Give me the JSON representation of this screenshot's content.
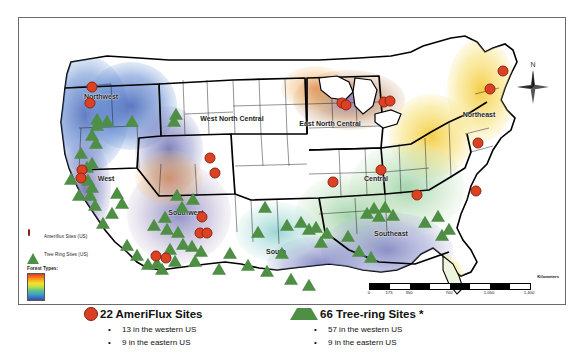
{
  "map": {
    "frame_label": "us-forest-types-site-map",
    "legend": {
      "title": "Forest Types:",
      "items": [
        {
          "icon": "circle-marker-icon",
          "label": "Ameriflux Sites (US)",
          "color": "#dc4123"
        },
        {
          "icon": "triangle-marker-icon",
          "label": "Tree Ring Sites (US)",
          "color": "#4f8f45"
        }
      ],
      "ramp_colors": [
        "#e23c1e",
        "#ef6b1f",
        "#f7a81e",
        "#f4e12a",
        "#b9e04a",
        "#5fc08c",
        "#3aa6c2",
        "#3f6fbe",
        "#3b4fa8"
      ]
    },
    "north_arrow": {
      "label": "N",
      "icon": "compass-rose-icon"
    },
    "scale_bar": {
      "units": "Kilometers",
      "ticks": [
        "0",
        "175",
        "350",
        "700",
        "1,050",
        "1,400"
      ]
    },
    "regions": [
      {
        "name": "Northwest",
        "x": 82,
        "y": 78
      },
      {
        "name": "West North Central",
        "x": 213,
        "y": 100
      },
      {
        "name": "East North Central",
        "x": 311,
        "y": 105
      },
      {
        "name": "Northeast",
        "x": 460,
        "y": 96
      },
      {
        "name": "West",
        "x": 87,
        "y": 160
      },
      {
        "name": "Southwest",
        "x": 167,
        "y": 194
      },
      {
        "name": "Central",
        "x": 357,
        "y": 160
      },
      {
        "name": "South",
        "x": 257,
        "y": 233
      },
      {
        "name": "Southeast",
        "x": 372,
        "y": 215
      }
    ],
    "ameriflux_sites": [
      {
        "x": 73,
        "y": 69
      },
      {
        "x": 71,
        "y": 85
      },
      {
        "x": 63,
        "y": 152
      },
      {
        "x": 62,
        "y": 160
      },
      {
        "x": 191,
        "y": 140
      },
      {
        "x": 196,
        "y": 155
      },
      {
        "x": 183,
        "y": 199
      },
      {
        "x": 181,
        "y": 215
      },
      {
        "x": 188,
        "y": 215
      },
      {
        "x": 137,
        "y": 238
      },
      {
        "x": 147,
        "y": 240
      },
      {
        "x": 323,
        "y": 85
      },
      {
        "x": 327,
        "y": 87
      },
      {
        "x": 365,
        "y": 84
      },
      {
        "x": 371,
        "y": 83
      },
      {
        "x": 362,
        "y": 152
      },
      {
        "x": 314,
        "y": 164
      },
      {
        "x": 484,
        "y": 53
      },
      {
        "x": 471,
        "y": 71
      },
      {
        "x": 459,
        "y": 125
      },
      {
        "x": 457,
        "y": 173
      },
      {
        "x": 398,
        "y": 177
      }
    ],
    "treering_sites": [
      {
        "x": 78,
        "y": 102
      },
      {
        "x": 78,
        "y": 108
      },
      {
        "x": 88,
        "y": 104
      },
      {
        "x": 73,
        "y": 118
      },
      {
        "x": 77,
        "y": 126
      },
      {
        "x": 62,
        "y": 136
      },
      {
        "x": 113,
        "y": 104
      },
      {
        "x": 155,
        "y": 104
      },
      {
        "x": 68,
        "y": 150
      },
      {
        "x": 73,
        "y": 146
      },
      {
        "x": 69,
        "y": 163
      },
      {
        "x": 73,
        "y": 170
      },
      {
        "x": 71,
        "y": 178
      },
      {
        "x": 76,
        "y": 188
      },
      {
        "x": 52,
        "y": 162
      },
      {
        "x": 60,
        "y": 178
      },
      {
        "x": 157,
        "y": 97
      },
      {
        "x": 158,
        "y": 178
      },
      {
        "x": 174,
        "y": 182
      },
      {
        "x": 146,
        "y": 200
      },
      {
        "x": 163,
        "y": 190
      },
      {
        "x": 135,
        "y": 208
      },
      {
        "x": 148,
        "y": 212
      },
      {
        "x": 159,
        "y": 215
      },
      {
        "x": 164,
        "y": 227
      },
      {
        "x": 151,
        "y": 232
      },
      {
        "x": 173,
        "y": 229
      },
      {
        "x": 138,
        "y": 246
      },
      {
        "x": 156,
        "y": 244
      },
      {
        "x": 182,
        "y": 234
      },
      {
        "x": 176,
        "y": 244
      },
      {
        "x": 129,
        "y": 247
      },
      {
        "x": 143,
        "y": 252
      },
      {
        "x": 268,
        "y": 208
      },
      {
        "x": 282,
        "y": 205
      },
      {
        "x": 290,
        "y": 212
      },
      {
        "x": 297,
        "y": 210
      },
      {
        "x": 308,
        "y": 216
      },
      {
        "x": 302,
        "y": 225
      },
      {
        "x": 329,
        "y": 219
      },
      {
        "x": 272,
        "y": 262
      },
      {
        "x": 290,
        "y": 268
      },
      {
        "x": 263,
        "y": 236
      },
      {
        "x": 246,
        "y": 190
      },
      {
        "x": 239,
        "y": 215
      },
      {
        "x": 348,
        "y": 196
      },
      {
        "x": 355,
        "y": 191
      },
      {
        "x": 366,
        "y": 190
      },
      {
        "x": 360,
        "y": 199
      },
      {
        "x": 374,
        "y": 198
      },
      {
        "x": 406,
        "y": 205
      },
      {
        "x": 419,
        "y": 199
      },
      {
        "x": 430,
        "y": 212
      },
      {
        "x": 423,
        "y": 218
      },
      {
        "x": 340,
        "y": 234
      },
      {
        "x": 352,
        "y": 240
      },
      {
        "x": 229,
        "y": 248
      },
      {
        "x": 248,
        "y": 254
      },
      {
        "x": 211,
        "y": 236
      },
      {
        "x": 200,
        "y": 252
      },
      {
        "x": 118,
        "y": 238
      },
      {
        "x": 108,
        "y": 228
      },
      {
        "x": 93,
        "y": 196
      },
      {
        "x": 84,
        "y": 206
      },
      {
        "x": 98,
        "y": 176
      },
      {
        "x": 103,
        "y": 186
      }
    ]
  },
  "caption": {
    "ameriflux": {
      "icon": "circle-marker-icon",
      "heading": "22 AmeriFlux Sites",
      "bullets": [
        "13 in the western US",
        "9 in the eastern US"
      ]
    },
    "treering": {
      "icon": "triangle-marker-icon",
      "heading": "66 Tree-ring Sites *",
      "bullets": [
        "57 in the western US",
        "9 in the eastern US"
      ]
    }
  }
}
